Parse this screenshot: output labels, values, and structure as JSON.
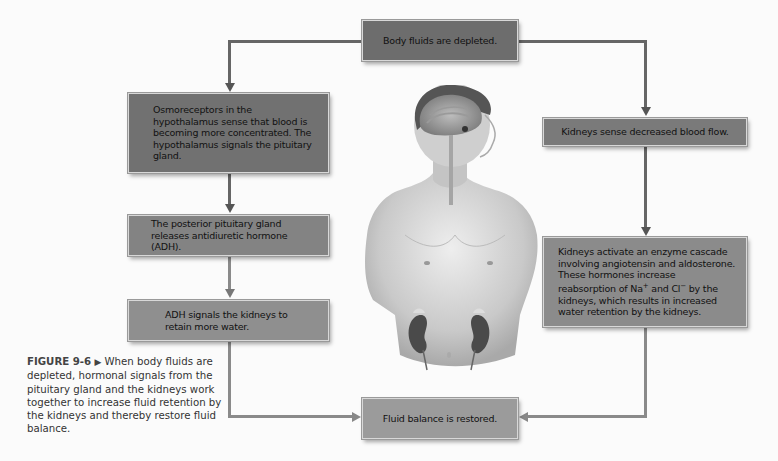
{
  "figure": {
    "caption_label": "FIGURE 9-6",
    "caption_marker": "▶",
    "caption_text": " When body fluids are depleted, hormonal signals from the pituitary gland and the kidneys work together to increase fluid retention by the kidneys and thereby restore fluid balance."
  },
  "flowchart": {
    "start": "Body fluids are depleted.",
    "left_branch": [
      "Osmoreceptors in the hypothalamus sense that blood is becoming more concentrated. The hypothalamus signals the pituitary gland.",
      "The posterior pituitary gland releases antidiuretic hormone (ADH).",
      "ADH signals the kidneys to retain more water."
    ],
    "right_branch": {
      "step1": "Kidneys sense decreased blood flow.",
      "step2_line1": "Kidneys activate an enzyme cascade involving angiotensin and aldosterone. These hormones increase reabsorption of Na",
      "step2_sup1": "+",
      "step2_mid": " and Cl",
      "step2_sup2": "−",
      "step2_end": " by the kidneys, which results in increased water retention by the kidneys."
    },
    "end": "Fluid balance is restored."
  },
  "colors": {
    "box_dark": "#6f6f6f",
    "box_mid": "#7d7d7d",
    "box_light": "#8e8e8e",
    "box_lightest": "#9c9c9c",
    "line": "#666666"
  }
}
